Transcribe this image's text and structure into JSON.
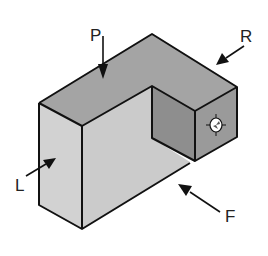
{
  "diagram": {
    "type": "isometric-view",
    "colors": {
      "top_face": "#a4a4a4",
      "left_face": "#d2d2d2",
      "front_face": "#cbcbcb",
      "inner_face": "#8e8e8e",
      "right_face": "#9a9a9a",
      "edge": "#111111",
      "hole": "#ffffff"
    },
    "labels": [
      {
        "id": "P",
        "text": "P",
        "meaning": "top view direction"
      },
      {
        "id": "R",
        "text": "R",
        "meaning": "right view direction"
      },
      {
        "id": "L",
        "text": "L",
        "meaning": "left view direction"
      },
      {
        "id": "F",
        "text": "F",
        "meaning": "front view direction"
      }
    ]
  }
}
